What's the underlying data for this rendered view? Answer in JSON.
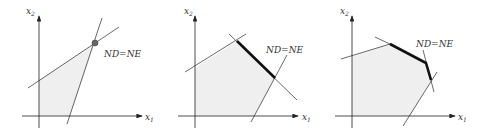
{
  "figure": {
    "panels": [
      {
        "id": "panel-1",
        "x_axis_label": "x",
        "x_axis_sub": "1",
        "y_axis_label": "x",
        "y_axis_sub": "2",
        "annotation": "ND=NE",
        "description": "Single efficient extreme point (marked dot)"
      },
      {
        "id": "panel-2",
        "x_axis_label": "x",
        "x_axis_sub": "1",
        "y_axis_label": "x",
        "y_axis_sub": "2",
        "annotation": "ND=NE",
        "description": "Efficient edge (bold segment)"
      },
      {
        "id": "panel-3",
        "x_axis_label": "x",
        "x_axis_sub": "1",
        "y_axis_label": "x",
        "y_axis_sub": "2",
        "annotation": "ND=NE",
        "description": "Efficient set of two connected edges (bold)"
      }
    ],
    "colors": {
      "region_fill": "#efefef",
      "line": "#333333",
      "bold_edge": "#111111",
      "point": "#666666"
    }
  }
}
